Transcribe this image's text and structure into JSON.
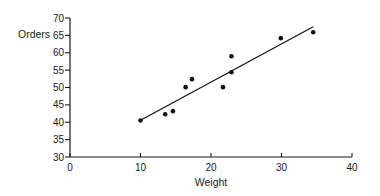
{
  "chart_data": {
    "type": "scatter",
    "title": "",
    "xlabel": "Weight",
    "ylabel": "Orders",
    "xlim": [
      0,
      40
    ],
    "ylim": [
      30,
      70
    ],
    "x_ticks": [
      0,
      10,
      20,
      30,
      40
    ],
    "y_ticks": [
      30,
      35,
      40,
      45,
      50,
      55,
      60,
      65,
      70
    ],
    "grid": false,
    "legend": null,
    "series": [
      {
        "name": "observations",
        "type": "scatter",
        "points": [
          {
            "x": 10.0,
            "y": 40.5
          },
          {
            "x": 13.5,
            "y": 42.3
          },
          {
            "x": 14.6,
            "y": 43.2
          },
          {
            "x": 16.4,
            "y": 50.1
          },
          {
            "x": 17.3,
            "y": 52.4
          },
          {
            "x": 21.7,
            "y": 50.1
          },
          {
            "x": 22.9,
            "y": 59.0
          },
          {
            "x": 22.9,
            "y": 54.4
          },
          {
            "x": 29.9,
            "y": 64.2
          },
          {
            "x": 34.5,
            "y": 65.9
          }
        ]
      },
      {
        "name": "fit-line",
        "type": "line",
        "points": [
          {
            "x": 10.0,
            "y": 40.6
          },
          {
            "x": 34.5,
            "y": 67.5
          }
        ]
      }
    ]
  },
  "colors": {
    "axis": "#1a1a1a",
    "marker": "#111111",
    "line": "#111111",
    "background": "#ffffff"
  }
}
